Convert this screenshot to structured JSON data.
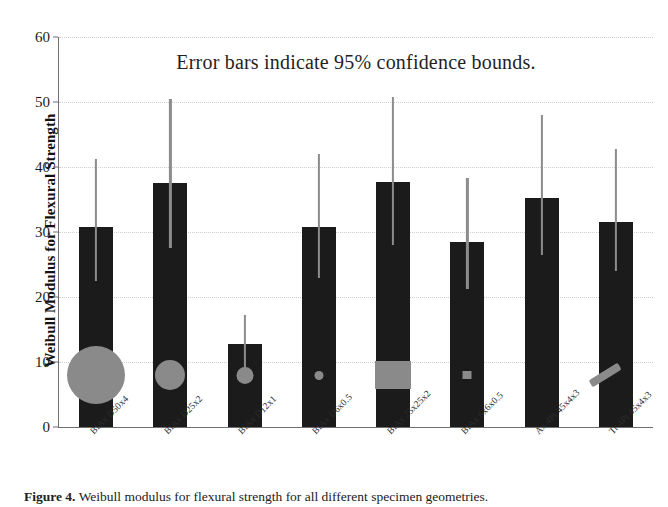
{
  "figure": {
    "in_plot_title": "Error bars indicate 95% confidence bounds.",
    "caption_prefix": "Figure 4.",
    "caption_text": " Weibull modulus for flexural strength for all different specimen geometries."
  },
  "chart_data": {
    "type": "bar",
    "title": "Error bars indicate 95% confidence bounds.",
    "xlabel": "",
    "ylabel": "Weibull Modulus for Flexural Strength",
    "ylim": [
      0,
      60
    ],
    "yticks": [
      0,
      10,
      20,
      30,
      40,
      50,
      60
    ],
    "ytick_labels": [
      "0",
      "10",
      "20",
      "30",
      "40",
      "50",
      "60"
    ],
    "grid": true,
    "legend": "none",
    "bar_color": "#1b1b1b",
    "error_color": "#8c8c8c",
    "specimen_color": "#8a8a8a",
    "categories": [
      "BiAx D50x4",
      "BiAx D25x2",
      "BiAx D12x1",
      "BiAx D6x0.5",
      "BiAx 25x25x2",
      "BiAx 6x6x0.5",
      "Ax 4Pt 45x4x3",
      "Tr 4Pt 45x4x3"
    ],
    "values": [
      30.7,
      37.5,
      12.8,
      30.7,
      37.7,
      28.5,
      35.3,
      31.5
    ],
    "ci_lower": [
      22.5,
      27.5,
      8.8,
      23.0,
      28.0,
      21.3,
      26.5,
      24.0
    ],
    "ci_upper": [
      41.3,
      50.5,
      17.3,
      42.0,
      50.7,
      38.3,
      48.0,
      42.7
    ],
    "specimens": [
      {
        "category": "BiAx D50x4",
        "shape": "circle",
        "w": 58,
        "h": 58
      },
      {
        "category": "BiAx D25x2",
        "shape": "circle",
        "w": 30,
        "h": 30
      },
      {
        "category": "BiAx D12x1",
        "shape": "circle",
        "w": 17,
        "h": 17
      },
      {
        "category": "BiAx D6x0.5",
        "shape": "circle",
        "w": 9,
        "h": 9
      },
      {
        "category": "BiAx 25x25x2",
        "shape": "square",
        "w": 36,
        "h": 28
      },
      {
        "category": "BiAx 6x6x0.5",
        "shape": "square",
        "w": 9,
        "h": 8
      },
      {
        "category": "Ax 4Pt 45x4x3",
        "shape": "bar-vertical",
        "w": 5,
        "h": 60
      },
      {
        "category": "Tr 4Pt 45x4x3",
        "shape": "bar-tilted",
        "w": 34,
        "h": 8,
        "angle": -32
      }
    ]
  }
}
